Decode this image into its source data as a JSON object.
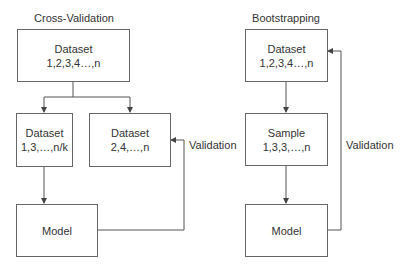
{
  "cross_validation": {
    "title": "Cross-Validation",
    "dataset_full": {
      "line1": "Dataset",
      "line2": "1,2,3,4…,n"
    },
    "dataset_train": {
      "line1": "Dataset",
      "line2": "1,3,…,n/k"
    },
    "dataset_validation": {
      "line1": "Dataset",
      "line2": "2,4,…,n"
    },
    "model": {
      "line1": "Model"
    },
    "validation_label": "Validation"
  },
  "bootstrapping": {
    "title": "Bootstrapping",
    "dataset": {
      "line1": "Dataset",
      "line2": "1,2,3,4…,n"
    },
    "sample": {
      "line1": "Sample",
      "line2": "1,3,3,…,n"
    },
    "model": {
      "line1": "Model"
    },
    "validation_label": "Validation"
  },
  "colors": {
    "line": "#555555",
    "text": "#333333",
    "background": "#ffffff"
  }
}
